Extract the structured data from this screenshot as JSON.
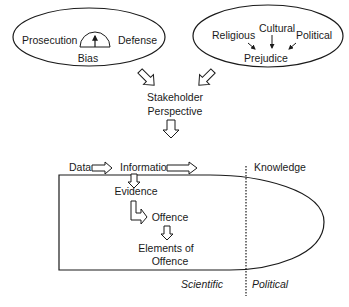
{
  "bias_group": {
    "left_label": "Prosecution",
    "right_label": "Defense",
    "center_label": "Bias",
    "gauge_icon": "gauge-icon"
  },
  "prejudice_group": {
    "sources": [
      "Religious",
      "Cultural",
      "Political"
    ],
    "center_label": "Prejudice"
  },
  "stakeholder": {
    "line1": "Stakeholder",
    "line2": "Perspective"
  },
  "flow": {
    "data": "Data",
    "information": "Information",
    "knowledge": "Knowledge",
    "evidence": "Evidence",
    "offence": "Offence",
    "elements_line1": "Elements of",
    "elements_line2": "Offence"
  },
  "domains": {
    "left": "Scientific",
    "right": "Political"
  },
  "colors": {
    "stroke": "#1a1a1a",
    "background": "#ffffff"
  }
}
